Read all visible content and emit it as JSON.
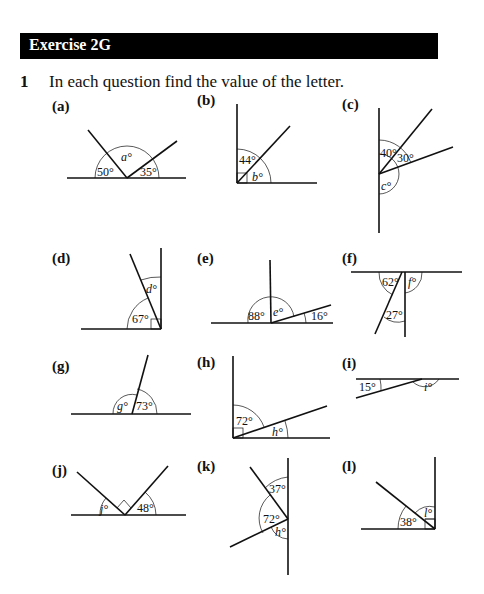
{
  "header": {
    "title": "Exercise 2G"
  },
  "question": {
    "number": "1",
    "text": "In each question find the value of the letter."
  },
  "parts": [
    {
      "label": "(a)",
      "angles": [
        "50°",
        "a°",
        "35°"
      ]
    },
    {
      "label": "(b)",
      "angles": [
        "44°",
        "b°"
      ]
    },
    {
      "label": "(c)",
      "angles": [
        "40°",
        "30°",
        "c°"
      ]
    },
    {
      "label": "(d)",
      "angles": [
        "d°",
        "67°"
      ]
    },
    {
      "label": "(e)",
      "angles": [
        "88°",
        "e°",
        "16°"
      ]
    },
    {
      "label": "(f)",
      "angles": [
        "62°",
        "f°",
        "27°"
      ]
    },
    {
      "label": "(g)",
      "angles": [
        "g°",
        "73°"
      ]
    },
    {
      "label": "(h)",
      "angles": [
        "72°",
        "h°"
      ]
    },
    {
      "label": "(i)",
      "angles": [
        "15°",
        "i°"
      ]
    },
    {
      "label": "(j)",
      "angles": [
        "j°",
        "48°"
      ]
    },
    {
      "label": "(k)",
      "angles": [
        "37°",
        "72°",
        "h°"
      ]
    },
    {
      "label": "(l)",
      "angles": [
        "38°",
        "l°"
      ]
    }
  ]
}
